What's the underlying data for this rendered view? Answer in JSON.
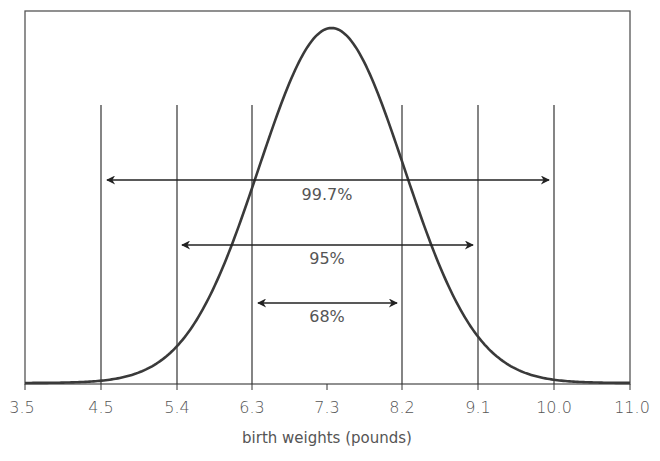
{
  "chart_data": {
    "type": "line",
    "title": "",
    "xlabel": "birth weights (pounds)",
    "ylabel": "",
    "xlim": [
      3.5,
      11.0
    ],
    "x_ticks": [
      "3.5",
      "4.5",
      "5.4",
      "6.3",
      "7.3",
      "8.2",
      "9.1",
      "10.0",
      "11.0"
    ],
    "distribution": {
      "kind": "normal",
      "mean": 7.3,
      "sd": 0.9
    },
    "vertical_lines_at": [
      4.5,
      5.4,
      6.3,
      8.2,
      9.1,
      10.0
    ],
    "intervals": [
      {
        "label": "99.7%",
        "from": 4.5,
        "to": 10.0
      },
      {
        "label": "95%",
        "from": 5.4,
        "to": 9.1
      },
      {
        "label": "68%",
        "from": 6.3,
        "to": 8.2
      }
    ],
    "grid": false,
    "legend": null
  },
  "axis": {
    "xlabel": "birth weights (pounds)",
    "ticks": [
      "3.5",
      "4.5",
      "5.4",
      "6.3",
      "7.3",
      "8.2",
      "9.1",
      "10.0",
      "11.0"
    ]
  },
  "intervals": {
    "outer": "99.7%",
    "middle": "95%",
    "inner": "68%"
  },
  "colors": {
    "line": "#3a3a3a",
    "text": "#555555",
    "frame": "#555555"
  }
}
